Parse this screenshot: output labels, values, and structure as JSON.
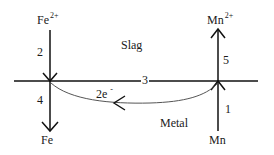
{
  "diagram": {
    "regions": {
      "upper": "Slag",
      "lower": "Metal"
    },
    "species": {
      "top_left": {
        "base": "Fe",
        "charge": "2+"
      },
      "bottom_left": {
        "base": "Fe"
      },
      "top_right": {
        "base": "Mn",
        "charge": "2+"
      },
      "bottom_right": {
        "base": "Mn"
      }
    },
    "step_labels": {
      "s1": "1",
      "s2": "2",
      "s3": "3",
      "s4": "4",
      "s5": "5"
    },
    "electron_label": {
      "base": "2e",
      "charge": "-"
    },
    "colors": {
      "line": "#111111",
      "curve": "#555555",
      "background": "#ffffff"
    }
  }
}
